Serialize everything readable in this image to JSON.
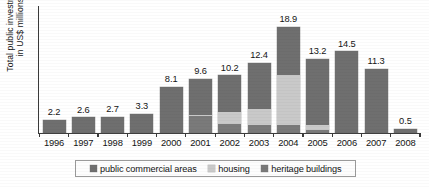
{
  "chart_data": {
    "type": "bar",
    "subtype": "stacked-bar",
    "title": "",
    "xlabel": "",
    "ylabel": "Total public investment in US$ millions",
    "ylabel_lines": [
      "Total public investment",
      "in US$ millions"
    ],
    "categories": [
      "1996",
      "1997",
      "1998",
      "1999",
      "2000",
      "2001",
      "2002",
      "2003",
      "2004",
      "2005",
      "2006",
      "2007",
      "2008"
    ],
    "totals": [
      2.2,
      2.6,
      2.7,
      3.3,
      8.1,
      9.6,
      10.2,
      12.4,
      18.9,
      13.2,
      14.5,
      11.3,
      0.5
    ],
    "total_labels": [
      "2.2",
      "2.6",
      "2.7",
      "3.3",
      "8.1",
      "9.6",
      "10.2",
      "12.4",
      "18.9",
      "13.2",
      "14.5",
      "11.3",
      "0.5"
    ],
    "series": [
      {
        "name": "public commercial areas",
        "color": "#6f6f6f",
        "values": [
          2.2,
          2.6,
          2.7,
          3.3,
          8.1,
          6.4,
          6.5,
          8.1,
          8.5,
          11.8,
          14.5,
          11.3,
          0.5
        ]
      },
      {
        "name": "housing",
        "color": "#c9c9c9",
        "values": [
          0.0,
          0.0,
          0.0,
          0.0,
          0.0,
          0.2,
          2.2,
          3.0,
          9.0,
          1.0,
          0.0,
          0.0,
          0.0
        ]
      },
      {
        "name": "heritage buildings",
        "color": "#7a7a7a",
        "values": [
          0.0,
          0.0,
          0.0,
          0.0,
          0.0,
          3.0,
          1.5,
          1.3,
          1.4,
          0.4,
          0.0,
          0.0,
          0.0
        ]
      }
    ],
    "ylim": [
      0,
      20.5
    ],
    "grid": false,
    "y_ticks_shown": false,
    "legend_position": "bottom",
    "legend_entries": [
      "public commercial areas",
      "housing",
      "heritage buildings"
    ]
  },
  "legend": {
    "items": [
      {
        "label": "public commercial areas",
        "swatch": "legend-swatch-commercial"
      },
      {
        "label": "housing",
        "swatch": "legend-swatch-housing"
      },
      {
        "label": "heritage buildings",
        "swatch": "legend-swatch-heritage"
      }
    ]
  },
  "colors": {
    "commercial": "#6f6f6f",
    "housing": "#c9c9c9",
    "heritage": "#7a7a7a",
    "axis": "#3a3a3a",
    "text": "#141414",
    "background": "#ffffff"
  }
}
